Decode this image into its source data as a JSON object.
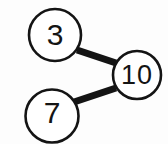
{
  "diagram": {
    "type": "number-bond",
    "background_color": "#fdfdfd",
    "stroke_color": "#141414",
    "fill_color": "#ffffff",
    "nodes": [
      {
        "id": "part1",
        "label": "3",
        "role": "part",
        "cx": 55,
        "cy": 35,
        "r": 27
      },
      {
        "id": "part2",
        "label": "7",
        "role": "part",
        "cx": 52,
        "cy": 116,
        "r": 27
      },
      {
        "id": "total",
        "label": "10",
        "role": "total",
        "cx": 137,
        "cy": 75,
        "r": 25
      }
    ],
    "connectors": [
      {
        "id": "connector-part1-total",
        "from": "part1",
        "to": "total",
        "x1": 77,
        "y1": 50,
        "x2": 116,
        "y2": 63,
        "width": 7
      },
      {
        "id": "connector-part2-total",
        "from": "part2",
        "to": "total",
        "x1": 74,
        "y1": 102,
        "x2": 116,
        "y2": 88,
        "width": 7
      }
    ]
  }
}
